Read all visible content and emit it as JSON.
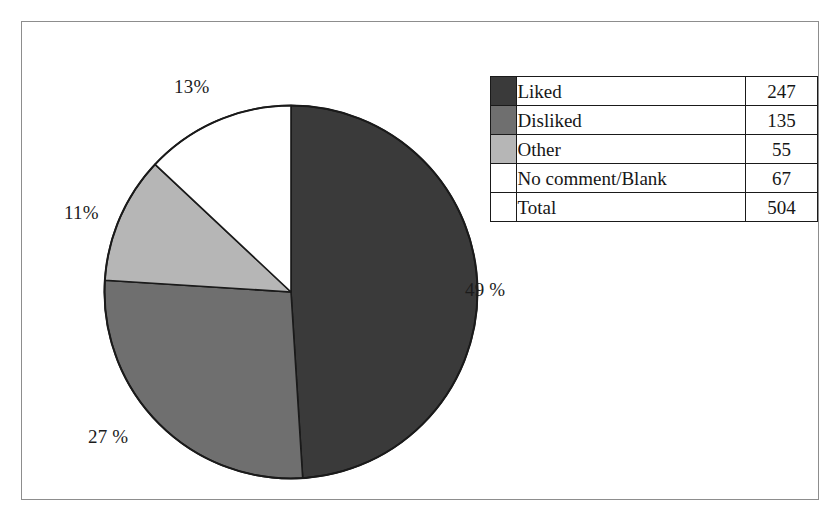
{
  "chart_data": {
    "type": "pie",
    "title": "",
    "categories": [
      "Liked",
      "Disliked",
      "Other",
      "No comment/Blank"
    ],
    "values": [
      247,
      135,
      55,
      67
    ],
    "percentages": [
      49,
      27,
      11,
      13
    ],
    "percent_labels": [
      "49 %",
      "27 %",
      "11%",
      "13%"
    ],
    "colors": [
      "#3a3a3a",
      "#6f6f6f",
      "#b6b6b6",
      "#ffffff"
    ],
    "total_label": "Total",
    "total_value": 504,
    "start_angle_deg": 0,
    "direction": "clockwise",
    "legend_position": "right",
    "grid": false,
    "xlabel": "",
    "ylabel": ""
  },
  "pie": {
    "slices": [
      {
        "name": "Liked",
        "value": 247,
        "percent": 49,
        "color": "#3a3a3a",
        "label": "49 %"
      },
      {
        "name": "Disliked",
        "value": 135,
        "percent": 27,
        "color": "#6f6f6f",
        "label": "27 %"
      },
      {
        "name": "Other",
        "value": 55,
        "percent": 11,
        "color": "#b6b6b6",
        "label": "11%"
      },
      {
        "name": "No comment/Blank",
        "value": 67,
        "percent": 13,
        "color": "#ffffff",
        "label": "13%"
      }
    ],
    "outline_color": "#1a1a1a"
  },
  "legend": {
    "rows": [
      {
        "label": "Liked",
        "value": "247",
        "color": "#3a3a3a"
      },
      {
        "label": "Disliked",
        "value": "135",
        "color": "#6f6f6f"
      },
      {
        "label": "Other",
        "value": "55",
        "color": "#b6b6b6"
      },
      {
        "label": "No comment/Blank",
        "value": "67",
        "color": "#ffffff"
      }
    ],
    "total": {
      "label": "Total",
      "value": "504"
    }
  },
  "frame": {
    "border_color": "#8d8d8d",
    "background": "#ffffff"
  }
}
